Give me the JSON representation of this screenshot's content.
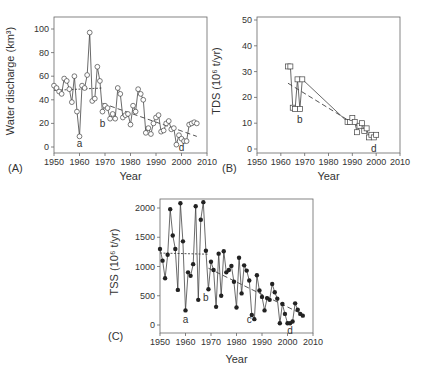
{
  "chart_data": [
    {
      "panel": "(A)",
      "type": "line",
      "marker": "open-circle",
      "xlabel": "Year",
      "ylabel": "Water discharge (km³)",
      "xlim": [
        1950,
        2010
      ],
      "ylim": [
        -3,
        110
      ],
      "xticks": [
        1950,
        1960,
        1970,
        1980,
        1990,
        2000,
        2010
      ],
      "yticks": [
        0,
        20,
        40,
        60,
        80,
        100
      ],
      "grid": false,
      "x": [
        1950,
        1951,
        1952,
        1953,
        1954,
        1955,
        1956,
        1957,
        1958,
        1959,
        1960,
        1961,
        1962,
        1963,
        1964,
        1965,
        1966,
        1967,
        1968,
        1969,
        1970,
        1971,
        1972,
        1973,
        1974,
        1975,
        1976,
        1977,
        1978,
        1979,
        1980,
        1981,
        1982,
        1983,
        1984,
        1985,
        1986,
        1987,
        1988,
        1989,
        1990,
        1991,
        1992,
        1993,
        1994,
        1995,
        1996,
        1997,
        1998,
        1999,
        2000,
        2001,
        2002,
        2003,
        2004,
        2005,
        2006
      ],
      "values": [
        52,
        50,
        47,
        45,
        58,
        56,
        49,
        38,
        60,
        30,
        9,
        52,
        50,
        61,
        97,
        39,
        41,
        68,
        56,
        30,
        35,
        33,
        24,
        28,
        24,
        50,
        45,
        25,
        27,
        28,
        19,
        35,
        30,
        49,
        45,
        40,
        12,
        16,
        11,
        20,
        25,
        27,
        13,
        14,
        20,
        22,
        15,
        16,
        2,
        10,
        7,
        5,
        5,
        19,
        20,
        21,
        20
      ],
      "trend_lines": [
        {
          "style": "dotted",
          "from": [
            1950,
            48
          ],
          "to": [
            1969,
            50
          ]
        },
        {
          "style": "dashed",
          "from": [
            1969,
            37
          ],
          "to": [
            2006,
            9
          ]
        }
      ],
      "annotations": [
        {
          "text": "a",
          "x": 1960,
          "y": 3
        },
        {
          "text": "b",
          "x": 1969,
          "y": 20
        },
        {
          "text": "d",
          "x": 2000,
          "y": 0
        }
      ]
    },
    {
      "panel": "(B)",
      "type": "line",
      "marker": "open-square",
      "xlabel": "Year",
      "ylabel": "TDS (10⁶ t/yr)",
      "xlim": [
        1950,
        2010
      ],
      "ylim": [
        -2,
        50
      ],
      "xticks": [
        1950,
        1960,
        1970,
        1980,
        1990,
        2000,
        2010
      ],
      "yticks": [
        0,
        10,
        20,
        30,
        40,
        50
      ],
      "grid": false,
      "x": [
        1963,
        1964,
        1965,
        1966,
        1967,
        1968,
        1969,
        1988,
        1989,
        1990,
        1991,
        1992,
        1993,
        1994,
        1995,
        1996,
        1997,
        1998,
        1999,
        2000
      ],
      "values": [
        32,
        32,
        16,
        15.5,
        27,
        15.5,
        27,
        10.5,
        10.5,
        12,
        10.5,
        6.5,
        9,
        10,
        7,
        8,
        4.5,
        5.5,
        4.5,
        5.5
      ],
      "trend_lines": [
        {
          "style": "dashed",
          "from": [
            1963,
            25.5
          ],
          "to": [
            2000,
            4.5
          ]
        }
      ],
      "annotations": [
        {
          "text": "b",
          "x": 1968,
          "y": 11.5
        },
        {
          "text": "d",
          "x": 1999,
          "y": 0.5
        }
      ]
    },
    {
      "panel": "(C)",
      "type": "line",
      "marker": "filled-circle",
      "xlabel": "Year",
      "ylabel": "TSS (10⁶ t/yr)",
      "xlim": [
        1950,
        2010
      ],
      "ylim": [
        -150,
        2200
      ],
      "xticks": [
        1950,
        1960,
        1970,
        1980,
        1990,
        2000,
        2010
      ],
      "yticks": [
        0,
        500,
        1000,
        1500,
        2000
      ],
      "grid": false,
      "x": [
        1950,
        1951,
        1952,
        1953,
        1954,
        1955,
        1956,
        1957,
        1958,
        1959,
        1960,
        1961,
        1962,
        1963,
        1964,
        1965,
        1966,
        1967,
        1968,
        1969,
        1970,
        1971,
        1972,
        1973,
        1974,
        1975,
        1976,
        1977,
        1978,
        1979,
        1980,
        1981,
        1982,
        1983,
        1984,
        1985,
        1986,
        1987,
        1988,
        1989,
        1990,
        1991,
        1992,
        1993,
        1994,
        1995,
        1996,
        1997,
        1998,
        1999,
        2000,
        2001,
        2002,
        2003,
        2004,
        2005,
        2006
      ],
      "values": [
        1300,
        1100,
        800,
        1200,
        1980,
        1530,
        1300,
        600,
        2080,
        1430,
        250,
        900,
        840,
        1040,
        2030,
        430,
        1800,
        2100,
        1270,
        610,
        1080,
        940,
        310,
        1220,
        500,
        1260,
        900,
        940,
        1010,
        740,
        300,
        1150,
        540,
        1020,
        930,
        760,
        170,
        100,
        850,
        590,
        480,
        250,
        460,
        430,
        700,
        560,
        450,
        30,
        360,
        190,
        30,
        30,
        60,
        370,
        260,
        190,
        160
      ],
      "trend_lines": [
        {
          "style": "dotted",
          "from": [
            1950,
            1230
          ],
          "to": [
            1969,
            1210
          ]
        },
        {
          "style": "dashed",
          "from": [
            1969,
            970
          ],
          "to": [
            2006,
            180
          ]
        }
      ],
      "annotations": [
        {
          "text": "a",
          "x": 1960,
          "y": 100
        },
        {
          "text": "b",
          "x": 1968,
          "y": 480
        },
        {
          "text": "c",
          "x": 1985,
          "y": 100
        },
        {
          "text": "d",
          "x": 2001,
          "y": -80
        }
      ]
    }
  ]
}
